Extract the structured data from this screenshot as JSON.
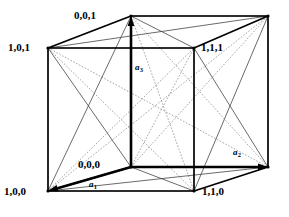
{
  "figure": {
    "type": "crystal-unit-cell-diagram",
    "background_color": "#ffffff",
    "line_color": "#000000",
    "hidden_line_color": "#808080"
  },
  "vertices": [
    {
      "id": "v001",
      "label": "0,0,1",
      "x": 131,
      "y": 16,
      "label_x": 74,
      "label_y": 10,
      "anchor": "upper-left"
    },
    {
      "id": "v101",
      "label": "1,0,1",
      "x": 48,
      "y": 48,
      "label_x": 8,
      "label_y": 42,
      "anchor": "left"
    },
    {
      "id": "v111",
      "label": "1,1,1",
      "x": 194,
      "y": 48,
      "label_x": 201,
      "label_y": 42,
      "anchor": "right"
    },
    {
      "id": "v011",
      "label": "",
      "x": 268,
      "y": 16,
      "label_x": 0,
      "label_y": 0,
      "anchor": "none"
    },
    {
      "id": "v000",
      "label": "0,0,0",
      "x": 131,
      "y": 167,
      "label_x": 78,
      "label_y": 159,
      "anchor": "left"
    },
    {
      "id": "v100",
      "label": "1,0,0",
      "x": 48,
      "y": 191,
      "label_x": 4,
      "label_y": 186,
      "anchor": "left"
    },
    {
      "id": "v110",
      "label": "1,1,0",
      "x": 194,
      "y": 191,
      "label_x": 202,
      "label_y": 186,
      "anchor": "right"
    },
    {
      "id": "v010",
      "label": "",
      "x": 268,
      "y": 167,
      "label_x": 0,
      "label_y": 0,
      "anchor": "none"
    }
  ],
  "axes": [
    {
      "id": "a1",
      "letter": "a",
      "subscript": "1",
      "label_x": 89,
      "label_y": 180,
      "from": "v000",
      "to": "v100",
      "direction": "down-left"
    },
    {
      "id": "a2",
      "letter": "a",
      "subscript": "2",
      "label_x": 233,
      "label_y": 148,
      "from": "v000",
      "to": "v010",
      "direction": "down-right"
    },
    {
      "id": "a3",
      "letter": "a",
      "subscript": "3",
      "label_x": 135,
      "label_y": 63,
      "from": "v000",
      "to": "v001",
      "direction": "up"
    }
  ],
  "edges": {
    "solid": [
      [
        "v101",
        "v001"
      ],
      [
        "v001",
        "v011"
      ],
      [
        "v011",
        "v111"
      ],
      [
        "v111",
        "v101"
      ],
      [
        "v100",
        "v000"
      ],
      [
        "v000",
        "v010"
      ],
      [
        "v010",
        "v110"
      ],
      [
        "v110",
        "v100"
      ],
      [
        "v101",
        "v100"
      ],
      [
        "v001",
        "v000"
      ],
      [
        "v111",
        "v110"
      ],
      [
        "v011",
        "v010"
      ]
    ]
  },
  "face_diagonals": {
    "solid": [
      [
        "v101",
        "v000"
      ],
      [
        "v001",
        "v100"
      ],
      [
        "v111",
        "v010"
      ],
      [
        "v011",
        "v110"
      ],
      [
        "v101",
        "v111"
      ],
      [
        "v001",
        "v011"
      ],
      [
        "v100",
        "v110"
      ],
      [
        "v000",
        "v010"
      ],
      [
        "v101",
        "v011"
      ],
      [
        "v001",
        "v111"
      ],
      [
        "v100",
        "v010"
      ],
      [
        "v000",
        "v110"
      ]
    ],
    "dotted": [
      [
        "v101",
        "v110"
      ],
      [
        "v100",
        "v111"
      ],
      [
        "v001",
        "v010"
      ],
      [
        "v000",
        "v011"
      ],
      [
        "v101",
        "v010"
      ],
      [
        "v100",
        "v011"
      ],
      [
        "v001",
        "v110"
      ],
      [
        "v000",
        "v111"
      ]
    ]
  },
  "meta": {
    "canvas_width": 289,
    "canvas_height": 217
  }
}
